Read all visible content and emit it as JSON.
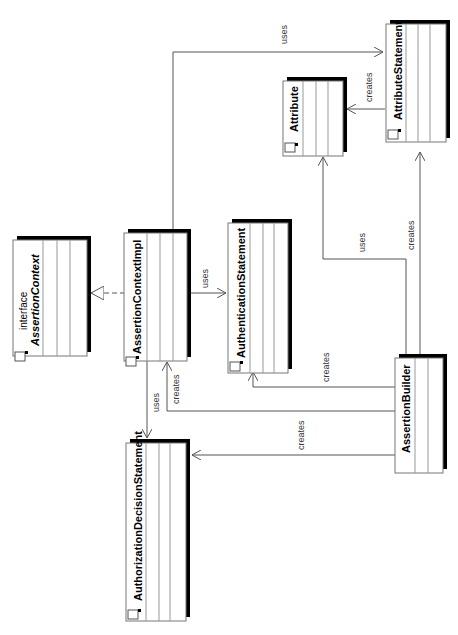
{
  "diagram": {
    "type": "UML class diagram",
    "orientation": "rotated 90 degrees counter-clockwise",
    "classes": [
      {
        "id": "assertion-context",
        "stereotype": "interface",
        "name": "AssertionContext"
      },
      {
        "id": "assertion-context-impl",
        "name": "AssertionContextImpl"
      },
      {
        "id": "authentication-statement",
        "name": "AuthenticationStatement"
      },
      {
        "id": "authorization-decision-statement",
        "name": "AuthorizationDecisionStatement"
      },
      {
        "id": "assertion-builder",
        "name": "AssertionBuilder"
      },
      {
        "id": "attribute",
        "name": "Attribute"
      },
      {
        "id": "attribute-statement",
        "name": "AttributeStatement"
      }
    ],
    "relations": [
      {
        "from": "AssertionContextImpl",
        "to": "AssertionContext",
        "type": "realization",
        "label": ""
      },
      {
        "from": "AssertionContextImpl",
        "to": "AuthenticationStatement",
        "type": "dependency",
        "label": "uses"
      },
      {
        "from": "AssertionContextImpl",
        "to": "AuthorizationDecisionStatement",
        "type": "dependency",
        "label": "uses"
      },
      {
        "from": "AssertionContextImpl",
        "to": "AttributeStatement",
        "type": "dependency",
        "label": "uses"
      },
      {
        "from": "AssertionBuilder",
        "to": "AssertionContextImpl",
        "type": "dependency",
        "label": "creates"
      },
      {
        "from": "AssertionBuilder",
        "to": "AuthenticationStatement",
        "type": "dependency",
        "label": "creates"
      },
      {
        "from": "AssertionBuilder",
        "to": "AuthorizationDecisionStatement",
        "type": "dependency",
        "label": "creates"
      },
      {
        "from": "AssertionBuilder",
        "to": "Attribute",
        "type": "dependency",
        "label": "uses"
      },
      {
        "from": "AssertionBuilder",
        "to": "AttributeStatement",
        "type": "dependency",
        "label": "creates"
      },
      {
        "from": "AttributeStatement",
        "to": "Attribute",
        "type": "dependency",
        "label": "creates"
      }
    ]
  },
  "labels": {
    "interface": "interface",
    "assertion_context": "AssertionContext",
    "assertion_context_impl": "AssertionContextImpl",
    "authentication_statement": "AuthenticationStatement",
    "authorization_decision_statement": "AuthorizationDecisionStatement",
    "assertion_builder": "AssertionBuilder",
    "attribute": "Attribute",
    "attribute_statement": "AttributeStatement",
    "uses": "uses",
    "creates": "creates"
  }
}
